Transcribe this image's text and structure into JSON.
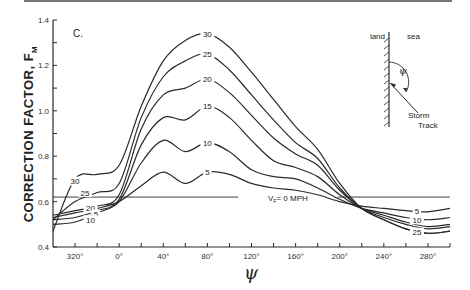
{
  "chart_data": {
    "type": "line",
    "title": "",
    "panel_label": "C.",
    "xlabel": "ψ",
    "ylabel": "CORRECTION FACTOR, F",
    "ylabel_subscript": "M",
    "xlim": [
      -60,
      300
    ],
    "ylim": [
      0.4,
      1.4
    ],
    "grid": false,
    "legend": "inline curve labels",
    "x_ticks": [
      -40,
      0,
      40,
      80,
      120,
      160,
      200,
      240,
      280
    ],
    "x_tick_labels": [
      "320°",
      "0°",
      "40°",
      "80°",
      "120°",
      "160°",
      "200°",
      "240°",
      "280°"
    ],
    "x_minor_step": 20,
    "y_ticks": [
      0.4,
      0.6,
      0.8,
      1.0,
      1.2,
      1.4
    ],
    "y_tick_labels": [
      "0.4",
      "0.6",
      "0.8",
      "1.0",
      "1.2",
      "1.4"
    ],
    "y_minor_step": 0.1,
    "reference_line": {
      "label": "V_F = 0 MPH",
      "y": 0.62
    },
    "x": [
      -60,
      -40,
      -20,
      0,
      20,
      40,
      60,
      80,
      100,
      120,
      140,
      160,
      180,
      200,
      220,
      240,
      260,
      280,
      300
    ],
    "series": [
      {
        "name": "5",
        "values": [
          0.53,
          0.55,
          0.57,
          0.6,
          0.67,
          0.73,
          0.68,
          0.73,
          0.72,
          0.68,
          0.66,
          0.65,
          0.63,
          0.6,
          0.58,
          0.57,
          0.56,
          0.555,
          0.57
        ]
      },
      {
        "name": "10",
        "values": [
          0.5,
          0.51,
          0.55,
          0.6,
          0.77,
          0.87,
          0.82,
          0.86,
          0.82,
          0.74,
          0.71,
          0.7,
          0.66,
          0.61,
          0.57,
          0.55,
          0.53,
          0.52,
          0.53
        ]
      },
      {
        "name": "15",
        "values": [
          0.52,
          0.53,
          0.56,
          0.61,
          0.85,
          0.97,
          0.96,
          1.02,
          0.97,
          0.87,
          0.78,
          0.75,
          0.71,
          0.63,
          0.57,
          0.54,
          0.51,
          0.49,
          0.5
        ]
      },
      {
        "name": "20",
        "values": [
          0.54,
          0.56,
          0.58,
          0.63,
          0.92,
          1.07,
          1.1,
          1.14,
          1.08,
          0.98,
          0.88,
          0.81,
          0.76,
          0.65,
          0.57,
          0.53,
          0.5,
          0.48,
          0.49
        ]
      },
      {
        "name": "25",
        "values": [
          0.52,
          0.6,
          0.64,
          0.68,
          0.97,
          1.15,
          1.22,
          1.25,
          1.18,
          1.07,
          0.96,
          0.86,
          0.79,
          0.66,
          0.57,
          0.52,
          0.48,
          0.46,
          0.47
        ]
      },
      {
        "name": "30",
        "values": [
          0.47,
          0.7,
          0.72,
          0.76,
          1.02,
          1.22,
          1.31,
          1.34,
          1.28,
          1.17,
          1.05,
          0.93,
          0.83,
          0.68,
          0.57,
          0.52,
          0.48,
          0.46,
          0.47
        ]
      }
    ],
    "curve_labels": [
      {
        "text": "30",
        "x": -40,
        "y": 0.69
      },
      {
        "text": "25",
        "x": -31,
        "y": 0.64
      },
      {
        "text": "20",
        "x": -26,
        "y": 0.57
      },
      {
        "text": "5",
        "x": -21,
        "y": 0.545
      },
      {
        "text": "10",
        "x": -26,
        "y": 0.52
      },
      {
        "text": "30",
        "x": 80,
        "y": 1.34
      },
      {
        "text": "25",
        "x": 80,
        "y": 1.25
      },
      {
        "text": "20",
        "x": 80,
        "y": 1.14
      },
      {
        "text": "15",
        "x": 80,
        "y": 1.02
      },
      {
        "text": "10",
        "x": 80,
        "y": 0.86
      },
      {
        "text": "5",
        "x": 80,
        "y": 0.73
      },
      {
        "text": "5",
        "x": 270,
        "y": 0.557
      },
      {
        "text": "10",
        "x": 270,
        "y": 0.52
      },
      {
        "text": "25",
        "x": 270,
        "y": 0.465
      }
    ],
    "inset": {
      "land_label": "land",
      "sea_label": "sea",
      "angle_label": "ψ",
      "track_label_1": "Storm",
      "track_label_2": "Track"
    }
  }
}
